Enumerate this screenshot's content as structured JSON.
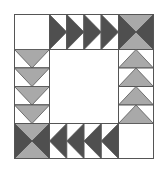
{
  "diagram": {
    "type": "quilt-block",
    "colors": {
      "dark": "#4f4f4f",
      "light": "#a9a9a9",
      "background": "#ffffff",
      "outline": "#555555"
    },
    "corners": {
      "top_left": "plain",
      "top_right": "hourglass",
      "bottom_left": "hourglass",
      "bottom_right": "plain"
    },
    "rows": {
      "top": {
        "count": 4,
        "direction": "right",
        "color": "dark"
      },
      "bottom": {
        "count": 4,
        "direction": "left",
        "color": "dark"
      },
      "left": {
        "count": 4,
        "direction": "down",
        "color": "light"
      },
      "right": {
        "count": 4,
        "direction": "up",
        "color": "light"
      }
    },
    "hourglass": {
      "top_bottom": "light",
      "left_right": "dark"
    }
  }
}
